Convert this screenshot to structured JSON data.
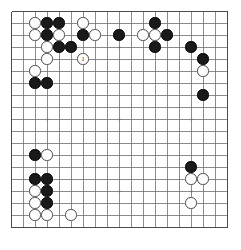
{
  "board": {
    "name": "go-board",
    "size": 19,
    "origin_x": 11,
    "origin_y": 11,
    "spacing": 12,
    "stone_radius": 5.6,
    "line_color": "#6e6e78",
    "border_color": "#4a4a55",
    "background_color": "#ffffff",
    "black_color": "#1a1a1a",
    "white_color": "#fdfdfd",
    "star_points": [
      [
        3,
        3
      ],
      [
        9,
        3
      ],
      [
        15,
        3
      ],
      [
        3,
        9
      ],
      [
        9,
        9
      ],
      [
        15,
        9
      ],
      [
        3,
        15
      ],
      [
        9,
        15
      ],
      [
        15,
        15
      ]
    ],
    "stones": [
      {
        "col": 2,
        "row": 1,
        "color": "white",
        "label": ""
      },
      {
        "col": 3,
        "row": 1,
        "color": "black",
        "label": ""
      },
      {
        "col": 4,
        "row": 1,
        "color": "black",
        "label": ""
      },
      {
        "col": 6,
        "row": 1,
        "color": "white",
        "label": ""
      },
      {
        "col": 12,
        "row": 1,
        "color": "black",
        "label": ""
      },
      {
        "col": 2,
        "row": 2,
        "color": "white",
        "label": ""
      },
      {
        "col": 3,
        "row": 2,
        "color": "black",
        "label": ""
      },
      {
        "col": 4,
        "row": 2,
        "color": "white",
        "label": ""
      },
      {
        "col": 6,
        "row": 2,
        "color": "black",
        "label": ""
      },
      {
        "col": 7,
        "row": 2,
        "color": "white",
        "label": ""
      },
      {
        "col": 9,
        "row": 2,
        "color": "black",
        "label": ""
      },
      {
        "col": 11,
        "row": 2,
        "color": "white",
        "label": ""
      },
      {
        "col": 12,
        "row": 2,
        "color": "white",
        "label": ""
      },
      {
        "col": 13,
        "row": 2,
        "color": "black",
        "label": ""
      },
      {
        "col": 3,
        "row": 3,
        "color": "white",
        "label": ""
      },
      {
        "col": 4,
        "row": 3,
        "color": "black",
        "label": ""
      },
      {
        "col": 5,
        "row": 3,
        "color": "black",
        "label": ""
      },
      {
        "col": 12,
        "row": 3,
        "color": "black",
        "label": ""
      },
      {
        "col": 15,
        "row": 3,
        "color": "black",
        "label": ""
      },
      {
        "col": 3,
        "row": 4,
        "color": "white",
        "label": ""
      },
      {
        "col": 6,
        "row": 4,
        "color": "white",
        "label": "1"
      },
      {
        "col": 16,
        "row": 4,
        "color": "black",
        "label": ""
      },
      {
        "col": 2,
        "row": 5,
        "color": "white",
        "label": ""
      },
      {
        "col": 16,
        "row": 5,
        "color": "white",
        "label": ""
      },
      {
        "col": 2,
        "row": 6,
        "color": "black",
        "label": ""
      },
      {
        "col": 3,
        "row": 6,
        "color": "black",
        "label": ""
      },
      {
        "col": 16,
        "row": 7,
        "color": "black",
        "label": ""
      },
      {
        "col": 2,
        "row": 12,
        "color": "black",
        "label": ""
      },
      {
        "col": 3,
        "row": 12,
        "color": "white",
        "label": ""
      },
      {
        "col": 15,
        "row": 13,
        "color": "black",
        "label": ""
      },
      {
        "col": 2,
        "row": 14,
        "color": "black",
        "label": ""
      },
      {
        "col": 3,
        "row": 14,
        "color": "black",
        "label": ""
      },
      {
        "col": 15,
        "row": 14,
        "color": "white",
        "label": ""
      },
      {
        "col": 16,
        "row": 14,
        "color": "white",
        "label": ""
      },
      {
        "col": 2,
        "row": 15,
        "color": "white",
        "label": ""
      },
      {
        "col": 3,
        "row": 15,
        "color": "black",
        "label": ""
      },
      {
        "col": 2,
        "row": 16,
        "color": "white",
        "label": ""
      },
      {
        "col": 3,
        "row": 16,
        "color": "black",
        "label": ""
      },
      {
        "col": 15,
        "row": 16,
        "color": "white",
        "label": ""
      },
      {
        "col": 2,
        "row": 17,
        "color": "white",
        "label": ""
      },
      {
        "col": 3,
        "row": 17,
        "color": "white",
        "label": ""
      },
      {
        "col": 5,
        "row": 17,
        "color": "white",
        "label": ""
      }
    ]
  }
}
